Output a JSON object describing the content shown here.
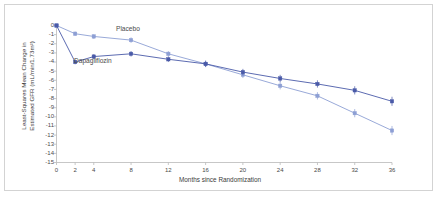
{
  "figure": {
    "border_color": "#d3d3d3",
    "background": "#ffffff"
  },
  "chart_data": {
    "type": "line",
    "title": "",
    "subtitle": "",
    "xlabel": "Months since Randomization",
    "ylabel": "Least-Squares Mean Change in Estimated GFR (mL/min/1.73m²)",
    "ylabel_line1": "Least-Squares Mean Change in",
    "ylabel_line2": "Estimated GFR  (mL/min/1.73m²)",
    "x": [
      0,
      2,
      4,
      8,
      12,
      16,
      20,
      24,
      28,
      32,
      36
    ],
    "xlim": [
      0,
      36
    ],
    "ylim": [
      -15,
      0
    ],
    "xticks": [
      "0",
      "2",
      "4",
      "8",
      "12",
      "16",
      "20",
      "24",
      "28",
      "32",
      "36"
    ],
    "yticks": [
      "0",
      "-1",
      "-2",
      "-3",
      "-4",
      "-5",
      "-6",
      "-7",
      "-8",
      "-9",
      "-10",
      "-11",
      "-12",
      "-13",
      "-14",
      "-15"
    ],
    "grid": false,
    "legend": "inline-annotations",
    "error_bars": true,
    "series": [
      {
        "name": "Placebo",
        "color": "#8d9fd4",
        "marker": "square",
        "label_position": "above-line",
        "values": [
          0.0,
          -0.9,
          -1.2,
          -1.6,
          -3.1,
          -4.2,
          -5.4,
          -6.6,
          -7.7,
          -9.6,
          -11.5
        ],
        "errors": [
          0.0,
          0.25,
          0.25,
          0.3,
          0.3,
          0.35,
          0.35,
          0.4,
          0.4,
          0.45,
          0.5
        ]
      },
      {
        "name": "Dapagliflozin",
        "color": "#4a5aa8",
        "marker": "square",
        "label_position": "below-line",
        "values": [
          0.0,
          -4.0,
          -3.4,
          -3.1,
          -3.7,
          -4.2,
          -5.1,
          -5.8,
          -6.4,
          -7.1,
          -8.3
        ],
        "errors": [
          0.0,
          0.25,
          0.25,
          0.3,
          0.3,
          0.35,
          0.35,
          0.4,
          0.4,
          0.45,
          0.5
        ]
      }
    ],
    "annotations": [
      {
        "text": "Placebo",
        "series": "Placebo"
      },
      {
        "text": "Dapagliflozin",
        "series": "Dapagliflozin"
      }
    ]
  }
}
